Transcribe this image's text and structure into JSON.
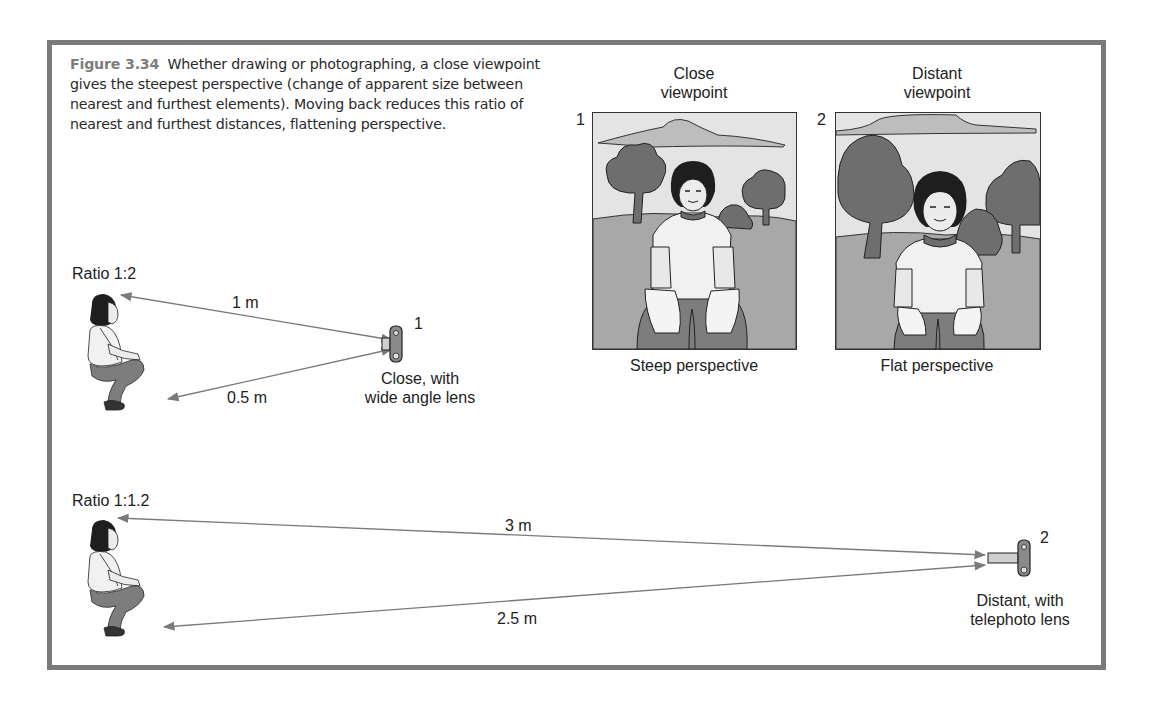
{
  "figure": {
    "number": "Figure 3.34",
    "caption": "Whether drawing or photographing, a close viewpoint gives the steepest perspective (change of apparent size between nearest and furthest elements). Moving back reduces this ratio of nearest and furthest distances, flattening perspective."
  },
  "panels": [
    {
      "index": "1",
      "title_line1": "Close",
      "title_line2": "viewpoint",
      "label": "Steep perspective"
    },
    {
      "index": "2",
      "title_line1": "Distant",
      "title_line2": "viewpoint",
      "label": "Flat perspective"
    }
  ],
  "setups": [
    {
      "ratio": "Ratio 1:2",
      "far_distance": "1 m",
      "near_distance": "0.5 m",
      "camera_index": "1",
      "camera_label_line1": "Close, with",
      "camera_label_line2": "wide angle lens"
    },
    {
      "ratio": "Ratio 1:1.2",
      "far_distance": "3 m",
      "near_distance": "2.5 m",
      "camera_index": "2",
      "camera_label_line1": "Distant, with",
      "camera_label_line2": "telephoto lens"
    }
  ],
  "colors": {
    "frame": "#7a7a7a",
    "figure_label": "#7d7d7d",
    "arrow": "#7a7a7a",
    "sky": "#e2e2e2",
    "ground": "#a8a8a8",
    "tree": "#6e6e6e",
    "hair": "#1e1e1e"
  }
}
